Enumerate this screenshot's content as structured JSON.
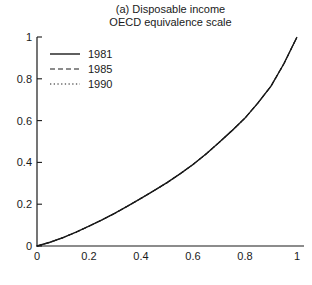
{
  "title": {
    "line1": "(a) Disposable income",
    "line2": "OECD equivalence scale"
  },
  "colors": {
    "line": "#1a1a1a",
    "background": "#ffffff",
    "text": "#1a1a1a"
  },
  "chart_data": {
    "type": "line",
    "title": "(a) Disposable income",
    "subtitle": "OECD equivalence scale",
    "xlabel": "",
    "ylabel": "",
    "xlim": [
      0,
      1
    ],
    "ylim": [
      0,
      1
    ],
    "grid": false,
    "legend_position": "top-left",
    "xticks": {
      "values": [
        0,
        0.2,
        0.4,
        0.6,
        0.8,
        1
      ],
      "labels": [
        "0",
        "0.2",
        "0.4",
        "0.6",
        "0.8",
        "1"
      ]
    },
    "yticks": {
      "values": [
        0,
        0.2,
        0.4,
        0.6,
        0.8,
        1
      ],
      "labels": [
        "0",
        "0.2",
        "0.4",
        "0.6",
        "0.8",
        "1"
      ]
    },
    "x": [
      0,
      0.05,
      0.1,
      0.15,
      0.2,
      0.25,
      0.3,
      0.35,
      0.4,
      0.45,
      0.5,
      0.55,
      0.6,
      0.65,
      0.7,
      0.75,
      0.8,
      0.85,
      0.9,
      0.95,
      1
    ],
    "series": [
      {
        "name": "1981",
        "style": "solid",
        "values": [
          0,
          0.018,
          0.04,
          0.066,
          0.095,
          0.125,
          0.157,
          0.192,
          0.228,
          0.265,
          0.303,
          0.345,
          0.39,
          0.44,
          0.495,
          0.552,
          0.612,
          0.685,
          0.765,
          0.873,
          1.0
        ]
      },
      {
        "name": "1985",
        "style": "dashed",
        "values": [
          0,
          0.018,
          0.04,
          0.066,
          0.095,
          0.125,
          0.157,
          0.192,
          0.228,
          0.265,
          0.303,
          0.345,
          0.39,
          0.44,
          0.495,
          0.552,
          0.612,
          0.685,
          0.765,
          0.873,
          1.0
        ]
      },
      {
        "name": "1990",
        "style": "dotted",
        "values": [
          0,
          0.018,
          0.04,
          0.066,
          0.095,
          0.125,
          0.157,
          0.192,
          0.228,
          0.265,
          0.303,
          0.345,
          0.39,
          0.44,
          0.495,
          0.552,
          0.612,
          0.685,
          0.765,
          0.873,
          1.0
        ]
      }
    ],
    "note": "The three Lorenz-type curves are visually coincident in the figure"
  }
}
